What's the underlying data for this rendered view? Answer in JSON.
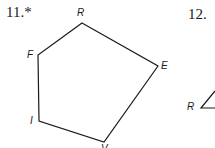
{
  "problems": [
    {
      "number": "11.*",
      "figure": "pentagon",
      "vertices": [
        {
          "label": "R",
          "x": 82,
          "y": 23
        },
        {
          "label": "E",
          "x": 158,
          "y": 66
        },
        {
          "label": "V",
          "x": 104,
          "y": 142
        },
        {
          "label": "I",
          "x": 39,
          "y": 121
        },
        {
          "label": "F",
          "x": 38,
          "y": 55
        }
      ]
    },
    {
      "number": "12.",
      "figure": "triangle (partially visible)",
      "vertices": [
        {
          "label": "R",
          "x": 201,
          "y": 107
        }
      ]
    }
  ],
  "colors": {
    "stroke": "#1a1a1a",
    "background": "#ffffff"
  }
}
